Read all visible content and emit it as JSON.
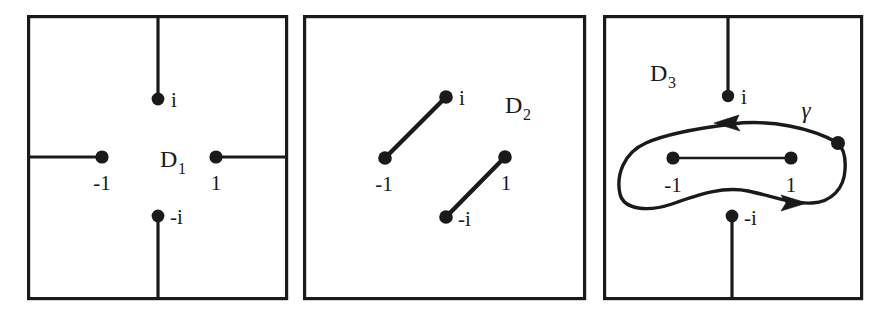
{
  "figure": {
    "caption": "",
    "background_color": "#ffffff",
    "ink_color": "#1a1a1a",
    "panel_count": 3
  },
  "panels": [
    {
      "id": "panel-1",
      "domain_label": "D",
      "domain_subscript": "1",
      "frame": {
        "x": 27,
        "y": 15,
        "width": 261,
        "height": 285
      },
      "description": "Square region with four radial slits from the boundary to the four points i, -1, 1, -i",
      "points": [
        {
          "name": "i",
          "label": "i",
          "x": 158,
          "y": 99,
          "label_x": 171,
          "label_y": 106
        },
        {
          "name": "-1",
          "label": "-1",
          "x": 102,
          "y": 157,
          "label_x": 88,
          "label_y": 187
        },
        {
          "name": "1",
          "label": "1",
          "x": 216,
          "y": 157,
          "label_x": 210,
          "label_y": 187
        },
        {
          "name": "-i",
          "label": "-i",
          "x": 158,
          "y": 216,
          "label_x": 170,
          "label_y": 223
        }
      ],
      "cuts": [
        {
          "name": "cut-top",
          "from": "top boundary",
          "x1": 158,
          "y1": 15,
          "x2": 158,
          "y2": 99
        },
        {
          "name": "cut-left",
          "from": "left boundary",
          "x1": 27,
          "y1": 157,
          "x2": 102,
          "y2": 157
        },
        {
          "name": "cut-right",
          "from": "right boundary",
          "x1": 288,
          "y1": 157,
          "x2": 216,
          "y2": 157
        },
        {
          "name": "cut-bottom",
          "from": "bottom boundary",
          "x1": 158,
          "y1": 300,
          "x2": 158,
          "y2": 216
        }
      ],
      "domain_label_x": 160,
      "domain_label_y": 166
    },
    {
      "id": "panel-2",
      "domain_label": "D",
      "domain_subscript": "2",
      "frame": {
        "x": 303,
        "y": 15,
        "width": 283,
        "height": 285
      },
      "description": "Square region with two interior slanted slits: from -1 to i and from -i to 1",
      "points": [
        {
          "name": "i",
          "label": "i",
          "x": 446,
          "y": 97,
          "label_x": 459,
          "label_y": 104
        },
        {
          "name": "-1",
          "label": "-1",
          "x": 385,
          "y": 158,
          "label_x": 371,
          "label_y": 188
        },
        {
          "name": "1",
          "label": "1",
          "x": 505,
          "y": 157,
          "label_x": 500,
          "label_y": 187
        },
        {
          "name": "-i",
          "label": "-i",
          "x": 446,
          "y": 217,
          "label_x": 458,
          "label_y": 225
        }
      ],
      "cuts": [
        {
          "name": "slit-minus1-to-i",
          "x1": 385,
          "y1": 158,
          "x2": 446,
          "y2": 97
        },
        {
          "name": "slit-minusi-to-1",
          "x1": 446,
          "y1": 217,
          "x2": 505,
          "y2": 157
        }
      ],
      "domain_label_x": 505,
      "domain_label_y": 112
    },
    {
      "id": "panel-3",
      "domain_label": "D",
      "domain_subscript": "3",
      "frame": {
        "x": 603,
        "y": 15,
        "width": 260,
        "height": 285
      },
      "description": "Square region with a vertical slit from the top boundary to i, a vertical slit from the bottom boundary to -i, a horizontal slit joining -1 and 1, and a closed oriented loop gamma encircling the horizontal slit",
      "points": [
        {
          "name": "i",
          "label": "i",
          "x": 728,
          "y": 96,
          "label_x": 741,
          "label_y": 103
        },
        {
          "name": "-1",
          "label": "-1",
          "x": 673,
          "y": 158,
          "label_x": 659,
          "label_y": 189
        },
        {
          "name": "1",
          "label": "1",
          "x": 791,
          "y": 158,
          "label_x": 786,
          "label_y": 189
        },
        {
          "name": "-i",
          "label": "-i",
          "x": 732,
          "y": 216,
          "label_x": 744,
          "label_y": 224
        },
        {
          "name": "gamma-basepoint",
          "label": "",
          "x": 838,
          "y": 143,
          "label_x": 0,
          "label_y": 0
        }
      ],
      "cuts": [
        {
          "name": "cut-top",
          "x1": 728,
          "y1": 15,
          "x2": 728,
          "y2": 96
        },
        {
          "name": "cut-bottom",
          "x1": 732,
          "y1": 300,
          "x2": 732,
          "y2": 216
        },
        {
          "name": "slit-minus1-to-1",
          "x1": 673,
          "y1": 158,
          "x2": 791,
          "y2": 158
        }
      ],
      "loop": {
        "name": "gamma",
        "label": "γ",
        "label_x": 806,
        "label_y": 116,
        "orientation": "clockwise-as-drawn (top arrow points left, bottom arrow points right)",
        "arrows": [
          {
            "name": "gamma-arrow-top",
            "x": 732,
            "y": 125,
            "direction": "left"
          },
          {
            "name": "gamma-arrow-bottom",
            "x": 793,
            "y": 203,
            "direction": "right"
          }
        ]
      },
      "domain_label_x": 663,
      "domain_label_y": 80
    }
  ]
}
